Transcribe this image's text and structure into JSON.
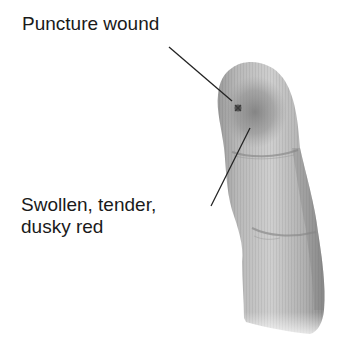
{
  "diagram": {
    "labels": [
      {
        "id": "puncture",
        "text": "Puncture wound"
      },
      {
        "id": "swollen",
        "lines": [
          "Swollen, tender,",
          "dusky red"
        ]
      }
    ],
    "colors": {
      "skin_light": "#c9c9c9",
      "skin_mid": "#a8a8a8",
      "skin_dark": "#7d7d7d",
      "swelling": "#8a8a8a",
      "puncture": "#4a4a4a",
      "leader_line": "#222222",
      "text": "#1a1a1a"
    }
  }
}
